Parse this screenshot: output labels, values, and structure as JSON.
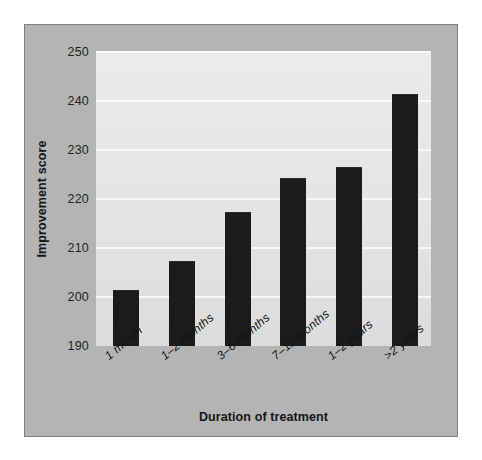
{
  "chart_data": {
    "type": "bar",
    "title": "",
    "subtitle": "",
    "xlabel": "Duration of treatment",
    "ylabel": "Improvement score",
    "categories": [
      "1 month",
      "1–2 months",
      "3–6 months",
      "7–11 months",
      "1–2 years",
      ">2 years"
    ],
    "values": [
      201.3,
      207.2,
      217.2,
      224.1,
      226.3,
      241.3
    ],
    "ylim": [
      190,
      250
    ],
    "yticks": [
      190,
      200,
      210,
      220,
      230,
      240,
      250
    ],
    "ytick_labels": [
      "190",
      "200",
      "210",
      "220",
      "230",
      "240",
      "250"
    ],
    "grid": true,
    "grid_axis": "y",
    "legend": false,
    "legend_position": "none",
    "series": [
      {
        "name": "Improvement score",
        "values": [
          201.3,
          207.2,
          217.2,
          224.1,
          226.3,
          241.3
        ]
      }
    ]
  },
  "style": {
    "bar_color": "#1b1b1b",
    "plot_background": "#e6e6e6",
    "figure_background": "#b4b4b4",
    "page_background": "#ffffff",
    "gridline_color": "#f8f8f8",
    "border_color": "#7d7f82",
    "text_color": "#161616"
  }
}
